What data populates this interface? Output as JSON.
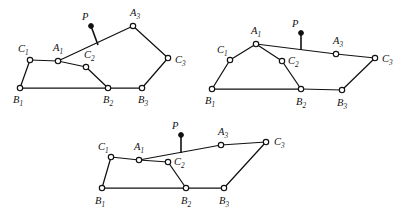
{
  "figure": {
    "stroke_color": "#111111",
    "node_fill": "#ffffff",
    "background": "#ffffff"
  },
  "labels": {
    "A1": "A",
    "A1_sub": "1",
    "A3": "A",
    "A3_sub": "3",
    "B1": "B",
    "B1_sub": "1",
    "B2": "B",
    "B2_sub": "2",
    "B3": "B",
    "B3_sub": "3",
    "C1": "C",
    "C1_sub": "1",
    "C2": "C",
    "C2_sub": "2",
    "C3": "C",
    "C3_sub": "3",
    "P": "P"
  },
  "chart_data": {
    "type": "diagram-scatter",
    "xlabel": "",
    "ylabel": "",
    "figures": [
      {
        "name": "figure-1",
        "points": {
          "C1": [
            30,
            60
          ],
          "A1": [
            58,
            61
          ],
          "C2": [
            86,
            67
          ],
          "A3": [
            133,
            26
          ],
          "C3": [
            168,
            58
          ],
          "B1": [
            20,
            88
          ],
          "B2": [
            108,
            88
          ],
          "B3": [
            142,
            88
          ],
          "P": [
            91,
            26
          ]
        },
        "p_stem_foot": [
          98,
          45
        ],
        "edges": [
          [
            "B1",
            "C1"
          ],
          [
            "C1",
            "A1"
          ],
          [
            "A1",
            "C2"
          ],
          [
            "C2",
            "B2"
          ],
          [
            "B1",
            "B2"
          ],
          [
            "B2",
            "B3"
          ],
          [
            "B3",
            "C3"
          ],
          [
            "C3",
            "A3"
          ],
          [
            "A3",
            "A1"
          ]
        ],
        "label_offsets": {
          "C1": [
            -12,
            -8
          ],
          "A1": [
            -5,
            -10
          ],
          "C2": [
            -2,
            -9
          ],
          "A3": [
            -3,
            -10
          ],
          "C3": [
            7,
            5
          ],
          "B1": [
            -7,
            15
          ],
          "B2": [
            -5,
            15
          ],
          "B3": [
            -4,
            15
          ],
          "P": [
            -9,
            -6
          ]
        }
      },
      {
        "name": "figure-2",
        "points": {
          "C1": [
            230,
            60
          ],
          "A1": [
            256,
            44
          ],
          "C2": [
            282,
            61
          ],
          "A3": [
            336,
            54
          ],
          "C3": [
            375,
            58
          ],
          "B1": [
            212,
            89
          ],
          "B2": [
            301,
            89
          ],
          "B3": [
            342,
            90
          ],
          "P": [
            301,
            33
          ]
        },
        "p_stem_foot": [
          301,
          50
        ],
        "edges": [
          [
            "B1",
            "C1"
          ],
          [
            "C1",
            "A1"
          ],
          [
            "A1",
            "C2"
          ],
          [
            "C2",
            "B2"
          ],
          [
            "B1",
            "B2"
          ],
          [
            "B2",
            "B3"
          ],
          [
            "B3",
            "C3"
          ],
          [
            "C3",
            "A3"
          ],
          [
            "A3",
            "A1"
          ]
        ],
        "label_offsets": {
          "C1": [
            -13,
            -7
          ],
          "A1": [
            -5,
            -10
          ],
          "C2": [
            6,
            3
          ],
          "A3": [
            -3,
            -10
          ],
          "C3": [
            7,
            4
          ],
          "B1": [
            -7,
            15
          ],
          "B2": [
            -5,
            16
          ],
          "B3": [
            -5,
            16
          ],
          "P": [
            -9,
            -6
          ]
        }
      },
      {
        "name": "figure-3",
        "points": {
          "C1": [
            111,
            157
          ],
          "A1": [
            139,
            160
          ],
          "C2": [
            168,
            162
          ],
          "A3": [
            221,
            145
          ],
          "C3": [
            266,
            142
          ],
          "B1": [
            102,
            188
          ],
          "B2": [
            186,
            188
          ],
          "B3": [
            224,
            188
          ],
          "P": [
            181,
            135
          ]
        },
        "p_stem_foot": [
          181,
          153
        ],
        "edges": [
          [
            "B1",
            "C1"
          ],
          [
            "C1",
            "A1"
          ],
          [
            "A1",
            "C2"
          ],
          [
            "C2",
            "B2"
          ],
          [
            "B1",
            "B2"
          ],
          [
            "B2",
            "B3"
          ],
          [
            "B3",
            "C3"
          ],
          [
            "C3",
            "A3"
          ],
          [
            "A3",
            "A1"
          ]
        ],
        "label_offsets": {
          "C1": [
            -13,
            -7
          ],
          "A1": [
            -5,
            -10
          ],
          "C2": [
            6,
            3
          ],
          "A3": [
            -3,
            -10
          ],
          "C3": [
            8,
            3
          ],
          "B1": [
            -7,
            16
          ],
          "B2": [
            -5,
            16
          ],
          "B3": [
            -5,
            16
          ],
          "P": [
            -9,
            -6
          ]
        }
      }
    ]
  }
}
